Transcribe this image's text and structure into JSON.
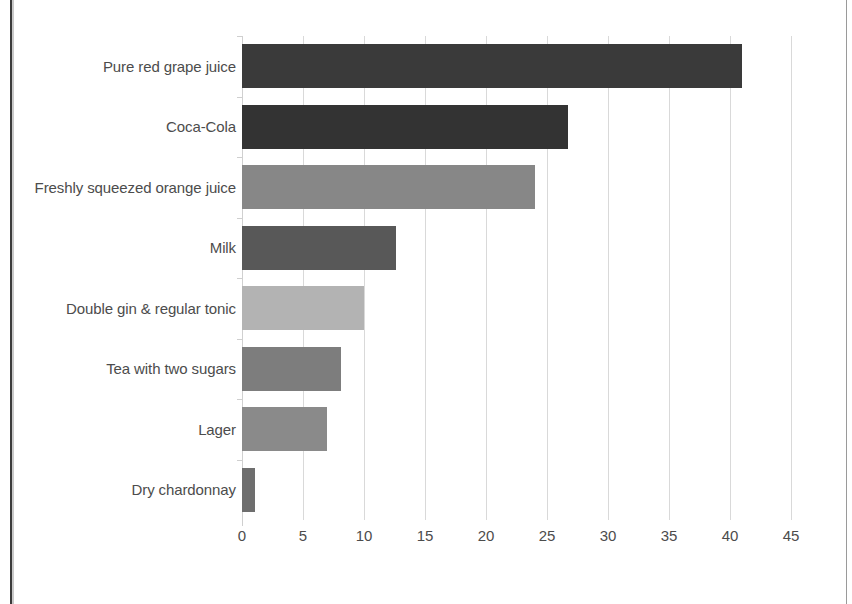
{
  "chart_data": {
    "type": "bar",
    "orientation": "horizontal",
    "title": "",
    "subtitle": "",
    "xlabel": "",
    "ylabel": "",
    "categories": [
      "Pure red grape juice",
      "Coca-Cola",
      "Freshly squeezed orange juice",
      "Milk",
      "Double gin & regular tonic",
      "Tea with two sugars",
      "Lager",
      "Dry chardonnay"
    ],
    "values": [
      41,
      26.7,
      24,
      12.6,
      10,
      8.1,
      7,
      1.1
    ],
    "bar_colors": [
      "#3a3a3a",
      "#333333",
      "#878787",
      "#585858",
      "#b3b3b3",
      "#7d7d7d",
      "#8a8a8a",
      "#6e6e6e"
    ],
    "xlim": [
      0,
      45
    ],
    "xticks": [
      0,
      5,
      10,
      15,
      20,
      25,
      30,
      35,
      40,
      45
    ],
    "xtick_labels": [
      "0",
      "5",
      "10",
      "15",
      "20",
      "25",
      "30",
      "35",
      "40",
      "45"
    ],
    "grid": "vertical",
    "legend": "none",
    "series_name": "Teaspoons of sugar"
  },
  "frame": {
    "border_left_color": "#3b3b3b",
    "border_right_color": "#9a9a9a",
    "background": "#ffffff"
  }
}
